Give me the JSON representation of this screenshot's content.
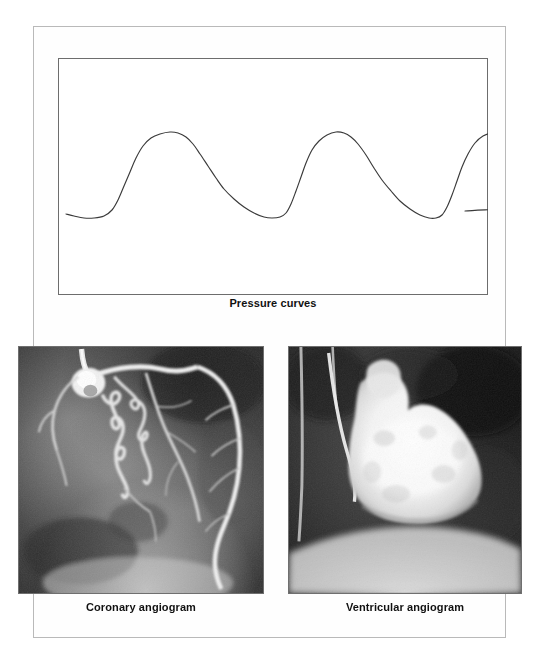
{
  "figure": {
    "background_color": "#ffffff",
    "frame_color": "#b9b9b9",
    "panel_border_color": "#6d6d6d",
    "caption_color": "#111111"
  },
  "panels": {
    "pressure": {
      "caption": "Pressure curves",
      "trace_color": "#3a3a3a"
    },
    "coronary": {
      "caption": "Coronary angiogram"
    },
    "ventricular": {
      "caption": "Ventricular angiogram"
    }
  },
  "chart_data": {
    "type": "line",
    "title": "Pressure curves",
    "xlabel": "",
    "ylabel": "",
    "grid": false,
    "legend": "none",
    "xlim": [
      0,
      430
    ],
    "ylim": [
      0,
      237
    ],
    "axis_visible": false,
    "series": [
      {
        "name": "Ventricular pressure",
        "cycles": 3,
        "baseline_y": 158,
        "peak_y": 75,
        "peak_x": [
          118,
          195,
          330
        ],
        "points": [
          [
            8,
            156
          ],
          [
            16,
            158
          ],
          [
            26,
            160
          ],
          [
            36,
            160
          ],
          [
            46,
            158
          ],
          [
            54,
            152
          ],
          [
            60,
            142
          ],
          [
            66,
            128
          ],
          [
            72,
            114
          ],
          [
            78,
            100
          ],
          [
            85,
            88
          ],
          [
            93,
            80
          ],
          [
            102,
            76
          ],
          [
            112,
            74
          ],
          [
            120,
            75
          ],
          [
            128,
            79
          ],
          [
            135,
            86
          ],
          [
            142,
            96
          ],
          [
            150,
            108
          ],
          [
            158,
            120
          ],
          [
            166,
            131
          ],
          [
            176,
            141
          ],
          [
            186,
            149
          ],
          [
            196,
            155
          ],
          [
            206,
            159
          ],
          [
            214,
            160
          ],
          [
            222,
            159
          ],
          [
            228,
            155
          ],
          [
            233,
            146
          ],
          [
            238,
            133
          ],
          [
            243,
            119
          ],
          [
            248,
            105
          ],
          [
            254,
            92
          ],
          [
            261,
            83
          ],
          [
            269,
            77
          ],
          [
            278,
            74
          ],
          [
            286,
            75
          ],
          [
            293,
            79
          ],
          [
            300,
            86
          ],
          [
            308,
            97
          ],
          [
            316,
            110
          ],
          [
            324,
            122
          ],
          [
            333,
            133
          ],
          [
            342,
            143
          ],
          [
            352,
            151
          ],
          [
            362,
            157
          ],
          [
            371,
            160
          ],
          [
            378,
            160
          ],
          [
            384,
            157
          ],
          [
            389,
            149
          ],
          [
            394,
            137
          ],
          [
            399,
            123
          ],
          [
            404,
            109
          ],
          [
            410,
            96
          ],
          [
            417,
            85
          ],
          [
            425,
            78
          ],
          [
            434,
            75
          ],
          [
            442,
            76
          ],
          [
            449,
            81
          ],
          [
            456,
            90
          ],
          [
            464,
            102
          ],
          [
            472,
            115
          ],
          [
            480,
            127
          ],
          [
            489,
            138
          ],
          [
            498,
            147
          ],
          [
            407,
            153
          ]
        ]
      }
    ]
  }
}
